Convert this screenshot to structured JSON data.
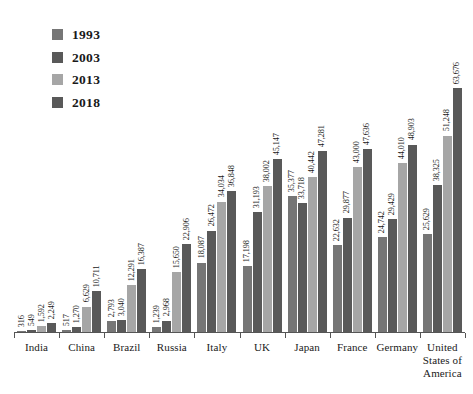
{
  "legend": {
    "position": "top-left",
    "items": [
      {
        "label": "1993",
        "color": "#767676",
        "swatch": "legend-swatch-1993"
      },
      {
        "label": "2003",
        "color": "#595959",
        "swatch": "legend-swatch-2003"
      },
      {
        "label": "2013",
        "color": "#a6a6a6",
        "swatch": "legend-swatch-2013"
      },
      {
        "label": "2018",
        "color": "#595959",
        "swatch": "legend-swatch-2018"
      }
    ]
  },
  "chart_data": {
    "type": "bar",
    "title": "",
    "subtitle": "",
    "xlabel": "",
    "ylabel": "",
    "grid": false,
    "legend_position": "top-left",
    "axis_visible": {
      "x": true,
      "y": false
    },
    "ylim": [
      0,
      63676
    ],
    "categories": [
      "India",
      "China",
      "Brazil",
      "Russia",
      "Italy",
      "UK",
      "Japan",
      "France",
      "Germany",
      "United States of America"
    ],
    "series": [
      {
        "name": "1993",
        "color": "#767676",
        "values": [
          316,
          517,
          2793,
          1239,
          18087,
          17198,
          35377,
          22632,
          24742,
          25629
        ]
      },
      {
        "name": "2003",
        "color": "#595959",
        "values": [
          549,
          1270,
          3040,
          2968,
          26472,
          31193,
          33718,
          29877,
          29429,
          38325
        ]
      },
      {
        "name": "2013",
        "color": "#a6a6a6",
        "values": [
          1592,
          6629,
          12291,
          15650,
          34034,
          38002,
          40442,
          43000,
          44010,
          51248
        ]
      },
      {
        "name": "2018",
        "color": "#595959",
        "values": [
          2249,
          10711,
          16387,
          22906,
          36848,
          45147,
          47281,
          47636,
          48903,
          63676
        ]
      }
    ],
    "value_labels": [
      [
        "316",
        "549",
        "1,592",
        "2,249"
      ],
      [
        "517",
        "1,270",
        "6,629",
        "10,711"
      ],
      [
        "2,793",
        "3,040",
        "12,291",
        "16,387"
      ],
      [
        "1,239",
        "2,968",
        "15,650",
        "22,906"
      ],
      [
        "18,087",
        "26,472",
        "34,034",
        "36,848"
      ],
      [
        "17,198",
        "31,193",
        "38,002",
        "45,147"
      ],
      [
        "35,377",
        "33,718",
        "40,442",
        "47,281"
      ],
      [
        "22,632",
        "29,877",
        "43,000",
        "47,636"
      ],
      [
        "24,742",
        "29,429",
        "44,010",
        "48,903"
      ],
      [
        "25,629",
        "38,325",
        "51,248",
        "63,676"
      ]
    ]
  }
}
